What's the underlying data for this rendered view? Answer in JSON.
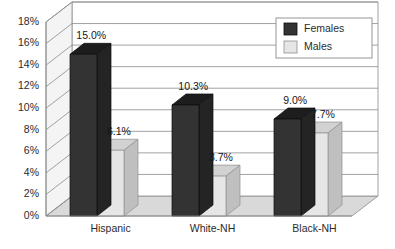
{
  "chart_data": {
    "type": "bar",
    "title": "",
    "subtitle": "",
    "xlabel": "",
    "ylabel": "",
    "categories": [
      "Hispanic",
      "White-NH",
      "Black-NH"
    ],
    "series": [
      {
        "name": "Females",
        "color": "#333333",
        "values": [
          15.0,
          10.3,
          9.0
        ],
        "labels": [
          "15.0%",
          "10.3%",
          "9.0%"
        ]
      },
      {
        "name": "Males",
        "color": "#e6e6e6",
        "values": [
          6.1,
          3.7,
          7.7
        ],
        "labels": [
          "6.1%",
          "3.7%",
          "7.7%"
        ]
      }
    ],
    "ylim": [
      0,
      18
    ],
    "ytick_values": [
      0,
      2,
      4,
      6,
      8,
      10,
      12,
      14,
      16,
      18
    ],
    "ytick_labels": [
      "0%",
      "2%",
      "4%",
      "6%",
      "8%",
      "10%",
      "12%",
      "14%",
      "16%",
      "18%"
    ],
    "grid": true,
    "legend_position": "top-right",
    "three_d": true
  },
  "legend": {
    "entries": [
      {
        "label": "Females",
        "swatch": "#333333"
      },
      {
        "label": "Males",
        "swatch": "#e6e6e6"
      }
    ]
  },
  "colors": {
    "series_dark": "#333333",
    "series_light": "#e6e6e6",
    "dark_top": "#1d1d1d",
    "dark_side": "#242424",
    "light_top": "#d2d2d2",
    "light_side": "#bfbfbf",
    "back_wall": "#ffffff",
    "side_wall": "#f4f4f4",
    "floor": "#d9d9d9",
    "gridline": "#8a8a8a",
    "frame": "#8a8a8a",
    "text": "#2b2b2b"
  }
}
